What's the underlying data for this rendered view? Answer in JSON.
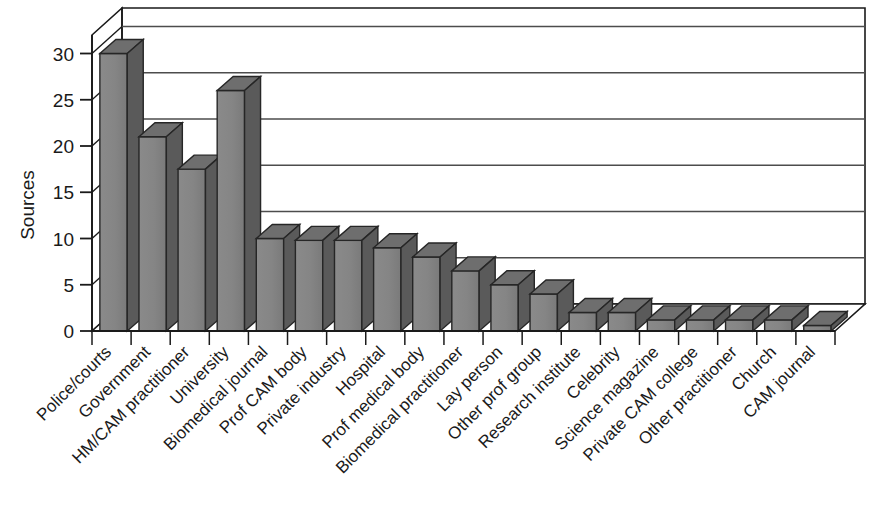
{
  "chart_data": {
    "type": "bar",
    "title": "",
    "subtitle": "",
    "xlabel": "",
    "ylabel": "Sources",
    "ylim": [
      0,
      32
    ],
    "yticks": [
      0,
      5,
      10,
      15,
      20,
      25,
      30
    ],
    "ytick_labels": [
      "0",
      "5",
      "10",
      "15",
      "20",
      "25",
      "30"
    ],
    "grid": true,
    "grid_axis": "y",
    "legend": "none",
    "style": "3d-bar",
    "bar_color": "#808080",
    "bar_top_color": "#6e6e6e",
    "bar_side_color": "#5a5a5a",
    "bar_edge_color": "#262626",
    "axis_color": "#1a1a1a",
    "grid_color": "#4d4d4d",
    "background": "#ffffff",
    "categories": [
      "Police/courts",
      "Government",
      "HM/CAM practitioner",
      "University",
      "Biomedical journal",
      "Prof CAM body",
      "Private industry",
      "Hospital",
      "Prof medical body",
      "Biomedical practitioner",
      "Lay person",
      "Other prof group",
      "Research institute",
      "Celebrity",
      "Science magazine",
      "Private CAM college",
      "Other practitioner",
      "Church",
      "CAM journal"
    ],
    "values": [
      30,
      21,
      17.5,
      26,
      10,
      9.8,
      9.8,
      9,
      8,
      6.5,
      5,
      4,
      2,
      2,
      1.2,
      1.2,
      1.2,
      1.2,
      0.6
    ]
  }
}
